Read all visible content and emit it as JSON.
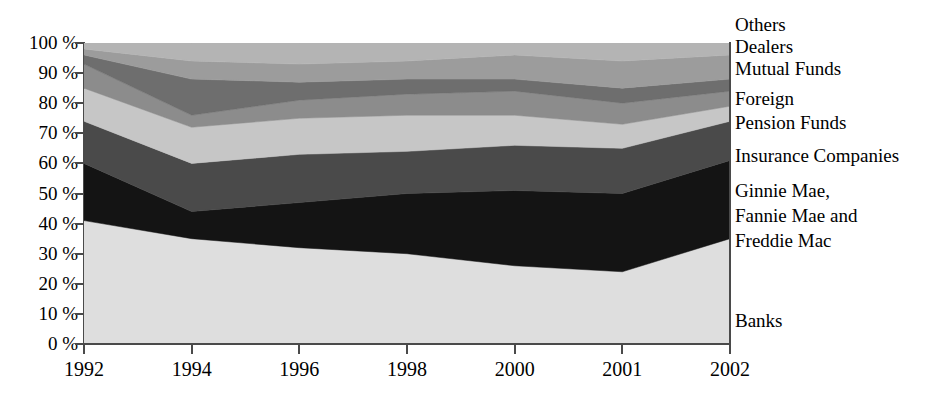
{
  "chart_data": {
    "type": "area",
    "title": "",
    "subtitle": "",
    "xlabel": "",
    "ylabel": "",
    "stacked": true,
    "normalized": true,
    "grid": false,
    "legend_position": "right",
    "ylim": [
      0,
      100
    ],
    "y_tick_labels": [
      "100 %",
      "90 %",
      "80 %",
      "70 %",
      "60 %",
      "50 %",
      "40 %",
      "30 %",
      "20 %",
      "10 %",
      "0 %"
    ],
    "y_tick_values": [
      100,
      90,
      80,
      70,
      60,
      50,
      40,
      30,
      20,
      10,
      0
    ],
    "categories": [
      "1992",
      "1994",
      "1996",
      "1998",
      "2000",
      "2001",
      "2002"
    ],
    "x": [
      1992,
      1994,
      1996,
      1998,
      2000,
      2001,
      2002
    ],
    "series": [
      {
        "name": "Banks",
        "color": "#dedede",
        "values": [
          41,
          35,
          32,
          30,
          26,
          24,
          35
        ]
      },
      {
        "name": "Ginnie Mae, Fannie Mae and Freddie Mac",
        "color": "#141414",
        "values": [
          19,
          9,
          15,
          20,
          25,
          26,
          26
        ]
      },
      {
        "name": "Insurance Companies",
        "color": "#4a4a4a",
        "values": [
          14,
          16,
          16,
          14,
          15,
          15,
          13
        ]
      },
      {
        "name": "Pension Funds",
        "color": "#c6c6c6",
        "values": [
          11,
          12,
          12,
          12,
          10,
          8,
          5
        ]
      },
      {
        "name": "Foreign",
        "color": "#8c8c8c",
        "values": [
          8,
          4,
          6,
          7,
          8,
          7,
          5
        ]
      },
      {
        "name": "Mutual Funds",
        "color": "#6e6e6e",
        "values": [
          3,
          12,
          6,
          5,
          4,
          5,
          4
        ]
      },
      {
        "name": "Dealers",
        "color": "#9c9c9c",
        "values": [
          2,
          6,
          6,
          6,
          8,
          9,
          8
        ]
      },
      {
        "name": "Others",
        "color": "#b4b4b4",
        "values": [
          2,
          6,
          7,
          6,
          4,
          6,
          4
        ]
      }
    ],
    "boundaries_percent": {
      "note": "cumulative top edge of each band, bottom to top",
      "1992": [
        41,
        60,
        74,
        85,
        93,
        96,
        98,
        100
      ],
      "1994": [
        35,
        44,
        60,
        72,
        76,
        88,
        94,
        100
      ],
      "1996": [
        32,
        47,
        63,
        75,
        81,
        87,
        93,
        100
      ],
      "1998": [
        30,
        50,
        64,
        76,
        83,
        88,
        94,
        100
      ],
      "2000": [
        26,
        51,
        66,
        76,
        84,
        88,
        92,
        100
      ],
      "2001": [
        24,
        50,
        65,
        73,
        80,
        85,
        90,
        100
      ],
      "2002": [
        35,
        61,
        74,
        79,
        84,
        88,
        92,
        100
      ]
    }
  },
  "legend": {
    "entries": [
      {
        "label": "Others"
      },
      {
        "label": "Dealers"
      },
      {
        "label": "Mutual Funds"
      },
      {
        "label": "Foreign"
      },
      {
        "label": "Pension Funds"
      },
      {
        "label": "Insurance Companies"
      },
      {
        "label": "Ginnie Mae,"
      },
      {
        "label": "Fannie Mae and"
      },
      {
        "label": "Freddie Mac"
      },
      {
        "label": "Banks"
      }
    ]
  },
  "colors": {
    "axis": "#4a4a4a",
    "text": "#000000",
    "background": "#ffffff"
  }
}
